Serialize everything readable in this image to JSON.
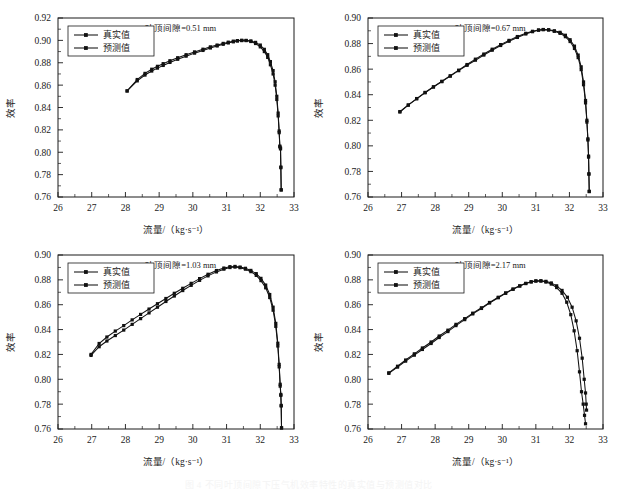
{
  "figure": {
    "caption": "图 4  不同叶顶间隙下压气机效率特性的真实值与预测值对比",
    "background": "#ffffff",
    "line_color": "#111111"
  },
  "common": {
    "xlabel": "流量/（kg·s⁻¹）",
    "ylabel": "效率",
    "xlim": [
      26,
      33
    ],
    "xticks": [
      26,
      27,
      28,
      29,
      30,
      31,
      32,
      33
    ],
    "legend": [
      {
        "label": "真实值",
        "marker": "square",
        "key": "true"
      },
      {
        "label": "预测值",
        "marker": "square",
        "key": "pred"
      }
    ]
  },
  "chart_data": [
    {
      "id": "panel-tip-clearance-051",
      "type": "line",
      "title": "叶顶间隙=0.51 mm",
      "xlabel": "流量/（kg·s⁻¹）",
      "ylabel": "效率",
      "xlim": [
        26,
        33
      ],
      "ylim": [
        0.76,
        0.92
      ],
      "xticks": [
        26,
        27,
        28,
        29,
        30,
        31,
        32,
        33
      ],
      "yticks": [
        0.76,
        0.78,
        0.8,
        0.82,
        0.84,
        0.86,
        0.88,
        0.9,
        0.92
      ],
      "ytick_labels": [
        "0.76",
        "0.78",
        "0.80",
        "0.82",
        "0.84",
        "0.86",
        "0.88",
        "0.90",
        "0.92"
      ],
      "grid": false,
      "legend_position": "top-left",
      "series": [
        {
          "name": "真实值",
          "x": [
            28.05,
            28.35,
            28.58,
            28.78,
            28.95,
            29.12,
            29.32,
            29.55,
            29.8,
            30.05,
            30.3,
            30.52,
            30.72,
            30.9,
            31.05,
            31.2,
            31.32,
            31.45,
            31.58,
            31.72,
            31.86,
            32.0,
            32.12,
            32.22,
            32.3,
            32.38,
            32.44,
            32.49,
            32.53,
            32.56,
            32.58,
            32.6,
            32.61,
            32.62
          ],
          "values": [
            0.8548,
            0.865,
            0.8705,
            0.8742,
            0.8768,
            0.8792,
            0.8818,
            0.8845,
            0.8872,
            0.8897,
            0.8921,
            0.8942,
            0.8958,
            0.8973,
            0.8984,
            0.8993,
            0.8998,
            0.9001,
            0.9,
            0.8995,
            0.8982,
            0.8958,
            0.892,
            0.8872,
            0.881,
            0.873,
            0.863,
            0.85,
            0.835,
            0.819,
            0.8055,
            0.8038,
            0.7868,
            0.7665
          ]
        },
        {
          "name": "预测值",
          "x": [
            28.05,
            28.35,
            28.58,
            28.78,
            28.95,
            29.12,
            29.32,
            29.55,
            29.8,
            30.05,
            30.3,
            30.52,
            30.72,
            30.9,
            31.05,
            31.2,
            31.32,
            31.45,
            31.58,
            31.72,
            31.86,
            32.0,
            32.12,
            32.22,
            32.3,
            32.38,
            32.44,
            32.49,
            32.53,
            32.56,
            32.58,
            32.6,
            32.61,
            32.62
          ],
          "values": [
            0.8548,
            0.8638,
            0.869,
            0.8726,
            0.8752,
            0.8776,
            0.8803,
            0.8831,
            0.8859,
            0.8886,
            0.891,
            0.8932,
            0.895,
            0.8965,
            0.8977,
            0.8987,
            0.8994,
            0.8998,
            0.8998,
            0.899,
            0.8972,
            0.8942,
            0.89,
            0.8848,
            0.8782,
            0.87,
            0.86,
            0.8472,
            0.8325,
            0.8175,
            0.8048,
            0.803,
            0.7862,
            0.7662
          ]
        }
      ]
    },
    {
      "id": "panel-tip-clearance-067",
      "type": "line",
      "title": "叶顶间隙=0.67 mm",
      "xlabel": "流量/（kg·s⁻¹）",
      "ylabel": "效率",
      "xlim": [
        26,
        33
      ],
      "ylim": [
        0.76,
        0.9
      ],
      "xticks": [
        26,
        27,
        28,
        29,
        30,
        31,
        32,
        33
      ],
      "yticks": [
        0.76,
        0.78,
        0.8,
        0.82,
        0.84,
        0.86,
        0.88,
        0.9
      ],
      "ytick_labels": [
        "0.76",
        "0.78",
        "0.80",
        "0.82",
        "0.84",
        "0.86",
        "0.88",
        "0.90"
      ],
      "grid": false,
      "legend_position": "top-left",
      "series": [
        {
          "name": "真实值",
          "x": [
            26.95,
            27.2,
            27.45,
            27.7,
            27.95,
            28.2,
            28.45,
            28.7,
            28.95,
            29.2,
            29.45,
            29.7,
            29.95,
            30.2,
            30.45,
            30.7,
            30.9,
            31.08,
            31.22,
            31.38,
            31.55,
            31.72,
            31.88,
            32.02,
            32.15,
            32.26,
            32.35,
            32.42,
            32.48,
            32.52,
            32.55,
            32.57,
            32.58,
            32.59
          ],
          "values": [
            0.8265,
            0.8318,
            0.8368,
            0.8415,
            0.846,
            0.8502,
            0.8545,
            0.8588,
            0.863,
            0.867,
            0.871,
            0.8748,
            0.8785,
            0.8818,
            0.8848,
            0.8875,
            0.8893,
            0.8905,
            0.891,
            0.8908,
            0.89,
            0.8888,
            0.8865,
            0.883,
            0.878,
            0.871,
            0.8618,
            0.85,
            0.8355,
            0.82,
            0.8055,
            0.792,
            0.7782,
            0.7645
          ]
        },
        {
          "name": "预测值",
          "x": [
            26.95,
            27.2,
            27.45,
            27.7,
            27.95,
            28.2,
            28.45,
            28.7,
            28.95,
            29.2,
            29.45,
            29.7,
            29.95,
            30.2,
            30.45,
            30.7,
            30.9,
            31.08,
            31.22,
            31.38,
            31.55,
            31.72,
            31.88,
            32.02,
            32.15,
            32.26,
            32.35,
            32.42,
            32.48,
            32.52,
            32.55,
            32.57,
            32.58,
            32.59
          ],
          "values": [
            0.8268,
            0.832,
            0.837,
            0.8418,
            0.8462,
            0.8505,
            0.8548,
            0.8592,
            0.8636,
            0.8678,
            0.8718,
            0.8756,
            0.8792,
            0.8825,
            0.8855,
            0.888,
            0.8896,
            0.8906,
            0.8909,
            0.8906,
            0.8896,
            0.888,
            0.8854,
            0.8816,
            0.8762,
            0.869,
            0.8596,
            0.8478,
            0.8336,
            0.8186,
            0.8046,
            0.7912,
            0.7778,
            0.7642
          ]
        }
      ]
    },
    {
      "id": "panel-tip-clearance-103",
      "type": "line",
      "title": "叶顶间隙=1.03 mm",
      "xlabel": "流量/（kg·s⁻¹）",
      "ylabel": "效率",
      "xlim": [
        26,
        33
      ],
      "ylim": [
        0.76,
        0.9
      ],
      "xticks": [
        26,
        27,
        28,
        29,
        30,
        31,
        32,
        33
      ],
      "yticks": [
        0.76,
        0.78,
        0.8,
        0.82,
        0.84,
        0.86,
        0.88,
        0.9
      ],
      "ytick_labels": [
        "0.76",
        "0.78",
        "0.80",
        "0.82",
        "0.84",
        "0.86",
        "0.88",
        "0.90"
      ],
      "grid": false,
      "legend_position": "top-left",
      "series": [
        {
          "name": "真实值",
          "x": [
            26.98,
            27.22,
            27.45,
            27.7,
            27.95,
            28.2,
            28.45,
            28.7,
            28.95,
            29.2,
            29.45,
            29.7,
            29.95,
            30.2,
            30.45,
            30.7,
            30.92,
            31.1,
            31.25,
            31.4,
            31.56,
            31.72,
            31.88,
            32.02,
            32.16,
            32.28,
            32.38,
            32.46,
            32.52,
            32.56,
            32.59,
            32.61,
            32.62,
            32.63
          ],
          "values": [
            0.82,
            0.8288,
            0.834,
            0.8388,
            0.8432,
            0.8478,
            0.8522,
            0.8565,
            0.8608,
            0.865,
            0.8692,
            0.8732,
            0.8772,
            0.881,
            0.8845,
            0.8875,
            0.8895,
            0.8906,
            0.8908,
            0.8903,
            0.8893,
            0.8876,
            0.885,
            0.8812,
            0.8758,
            0.8682,
            0.858,
            0.845,
            0.829,
            0.812,
            0.796,
            0.7878,
            0.779,
            0.761
          ]
        },
        {
          "name": "预测值",
          "x": [
            26.98,
            27.22,
            27.45,
            27.7,
            27.95,
            28.2,
            28.45,
            28.7,
            28.95,
            29.2,
            29.45,
            29.7,
            29.95,
            30.2,
            30.45,
            30.7,
            30.92,
            31.1,
            31.25,
            31.4,
            31.56,
            31.72,
            31.88,
            32.02,
            32.16,
            32.28,
            32.38,
            32.46,
            32.52,
            32.56,
            32.59,
            32.61,
            32.62,
            32.63
          ],
          "values": [
            0.8192,
            0.8262,
            0.8308,
            0.8352,
            0.8396,
            0.8442,
            0.8488,
            0.8534,
            0.858,
            0.8626,
            0.867,
            0.8714,
            0.8756,
            0.8796,
            0.8832,
            0.8864,
            0.8886,
            0.8899,
            0.8903,
            0.8898,
            0.8886,
            0.8866,
            0.8836,
            0.8794,
            0.8736,
            0.8658,
            0.8556,
            0.8426,
            0.8268,
            0.81,
            0.7945,
            0.787,
            0.7785,
            0.7608
          ]
        }
      ]
    },
    {
      "id": "panel-tip-clearance-217",
      "type": "line",
      "title": "叶顶间隙=2.17 mm",
      "xlabel": "流量/（kg·s⁻¹）",
      "ylabel": "效率",
      "xlim": [
        26,
        33
      ],
      "ylim": [
        0.76,
        0.9
      ],
      "xticks": [
        26,
        27,
        28,
        29,
        30,
        31,
        32,
        33
      ],
      "yticks": [
        0.76,
        0.78,
        0.8,
        0.82,
        0.84,
        0.86,
        0.88,
        0.9
      ],
      "ytick_labels": [
        "0.76",
        "0.78",
        "0.80",
        "0.82",
        "0.84",
        "0.86",
        "0.88",
        "0.90"
      ],
      "grid": false,
      "legend_position": "top-left",
      "series": [
        {
          "name": "真实值",
          "x": [
            26.62,
            26.88,
            27.12,
            27.38,
            27.62,
            27.88,
            28.12,
            28.38,
            28.62,
            28.88,
            29.12,
            29.38,
            29.62,
            29.88,
            30.1,
            30.32,
            30.52,
            30.7,
            30.86,
            31.0,
            31.15,
            31.3,
            31.46,
            31.62,
            31.78,
            31.94,
            32.08,
            32.2,
            32.3,
            32.38,
            32.44,
            32.48,
            32.5,
            32.51
          ],
          "values": [
            0.8052,
            0.8105,
            0.8155,
            0.8205,
            0.8252,
            0.83,
            0.8348,
            0.8395,
            0.8442,
            0.8488,
            0.8532,
            0.8575,
            0.8618,
            0.866,
            0.8695,
            0.8726,
            0.8752,
            0.8772,
            0.8785,
            0.8792,
            0.8793,
            0.8788,
            0.8775,
            0.8752,
            0.8715,
            0.866,
            0.858,
            0.847,
            0.833,
            0.817,
            0.8,
            0.789,
            0.78,
            0.7752
          ]
        },
        {
          "name": "预测值",
          "x": [
            26.62,
            26.88,
            27.12,
            27.38,
            27.62,
            27.88,
            28.12,
            28.38,
            28.62,
            28.88,
            29.12,
            29.38,
            29.62,
            29.88,
            30.1,
            30.32,
            30.52,
            30.7,
            30.86,
            31.0,
            31.15,
            31.3,
            31.46,
            31.62,
            31.78,
            31.92,
            32.04,
            32.14,
            32.23,
            32.3,
            32.36,
            32.41,
            32.45,
            32.48
          ],
          "values": [
            0.8048,
            0.8098,
            0.8146,
            0.8194,
            0.824,
            0.8288,
            0.8336,
            0.8384,
            0.8432,
            0.848,
            0.8526,
            0.857,
            0.8614,
            0.8656,
            0.8692,
            0.8724,
            0.875,
            0.877,
            0.8783,
            0.879,
            0.879,
            0.8782,
            0.8766,
            0.8738,
            0.8692,
            0.862,
            0.852,
            0.839,
            0.823,
            0.806,
            0.79,
            0.78,
            0.771,
            0.7642
          ]
        }
      ]
    }
  ]
}
